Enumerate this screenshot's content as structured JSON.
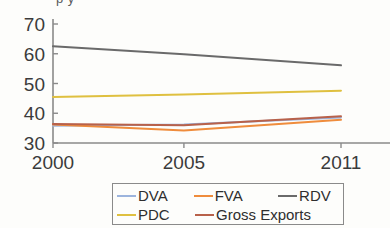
{
  "figure": {
    "title_remnant": "p                         y",
    "background_color": "#fdfdfb",
    "axis_color": "#8a8a8a"
  },
  "legend": {
    "position": "below-plot",
    "rows": [
      [
        {
          "label": "DVA",
          "color": "#9cb4dd"
        },
        {
          "label": "FVA",
          "color": "#ef8c3c"
        },
        {
          "label": "RDV",
          "color": "#6a6a6a"
        }
      ],
      [
        {
          "label": "PDC",
          "color": "#dfc040"
        },
        {
          "label": "Gross Exports",
          "color": "#b8614a"
        }
      ]
    ]
  },
  "chart_data": {
    "type": "line",
    "title": "",
    "xlabel": "",
    "ylabel": "",
    "x": [
      2000,
      2005,
      2011
    ],
    "xticks": [
      "2000",
      "2005",
      "2011"
    ],
    "yticks": [
      30,
      40,
      50,
      60,
      70
    ],
    "ylim": [
      30,
      70
    ],
    "xlim": [
      2000,
      2011
    ],
    "grid": false,
    "legend_position": "bottom",
    "series": [
      {
        "name": "DVA",
        "color": "#9cb4dd",
        "values": [
          35.8,
          36.2,
          38.6
        ]
      },
      {
        "name": "FVA",
        "color": "#ef8c3c",
        "values": [
          36.2,
          34.2,
          37.8
        ]
      },
      {
        "name": "RDV",
        "color": "#6a6a6a",
        "values": [
          62.5,
          59.8,
          56.1
        ]
      },
      {
        "name": "PDC",
        "color": "#dfc040",
        "values": [
          45.5,
          46.3,
          47.6
        ]
      },
      {
        "name": "Gross Exports",
        "color": "#b8614a",
        "values": [
          36.4,
          36.0,
          39.0
        ]
      }
    ]
  }
}
